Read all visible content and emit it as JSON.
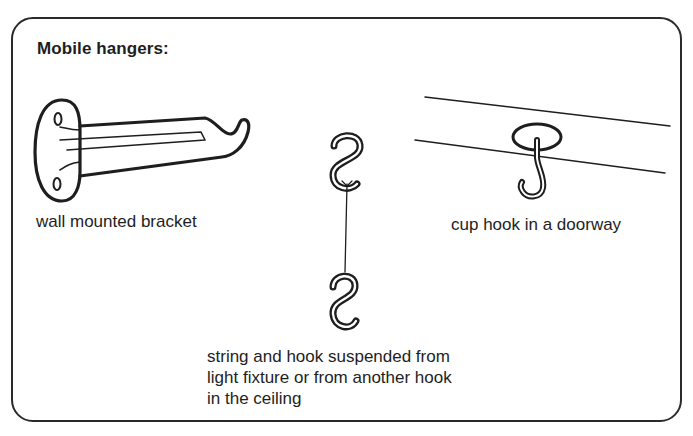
{
  "title": "Mobile hangers:",
  "items": [
    {
      "id": "wall-bracket",
      "label": "wall mounted bracket",
      "icon": "wall-bracket-icon"
    },
    {
      "id": "string-hook",
      "label_lines": [
        "string and hook suspended from",
        "light fixture or from another hook",
        "in the ceiling"
      ],
      "icon": "s-hook-icon"
    },
    {
      "id": "cup-hook",
      "label": "cup hook in a doorway",
      "icon": "cup-hook-icon"
    }
  ],
  "colors": {
    "ink": "#1e1e1e",
    "frame": "#2a2a2a",
    "background": "#ffffff"
  }
}
